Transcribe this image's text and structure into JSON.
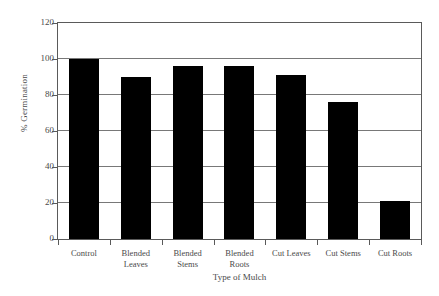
{
  "chart_data": {
    "type": "bar",
    "title": "",
    "xlabel": "Type of Mulch",
    "ylabel": "% Germination",
    "categories": [
      "Control",
      "Blended Leaves",
      "Blended Stems",
      "Blended Roots",
      "Cut Leaves",
      "Cut Stems",
      "Cut Roots"
    ],
    "category_lines": [
      [
        "Control"
      ],
      [
        "Blended",
        "Leaves"
      ],
      [
        "Blended",
        "Stems"
      ],
      [
        "Blended",
        "Roots"
      ],
      [
        "Cut Leaves"
      ],
      [
        "Cut Stems"
      ],
      [
        "Cut Roots"
      ]
    ],
    "values": [
      100,
      90,
      96,
      96,
      91,
      76,
      21
    ],
    "ylim": [
      0,
      120
    ],
    "ytick_step": 20,
    "yticks": [
      0,
      20,
      40,
      60,
      80,
      100,
      120
    ],
    "ytick_labels": [
      "0",
      "20",
      "40",
      "60",
      "80",
      "100",
      "120"
    ],
    "grid": true,
    "legend": false,
    "bar_color": "#000000",
    "axis_color": "#5a5a5a",
    "grid_color": "#787878",
    "background_color": "#ffffff"
  }
}
